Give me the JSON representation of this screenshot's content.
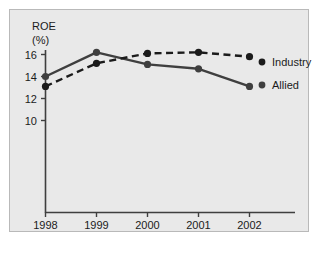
{
  "chart_data": {
    "type": "line",
    "title": "",
    "xlabel": "",
    "ylabel": "ROE (%)",
    "ylabel_lines": [
      "ROE",
      "(%)"
    ],
    "categories": [
      "1998",
      "1999",
      "2000",
      "2001",
      "2002"
    ],
    "x": [
      1998,
      1999,
      2000,
      2001,
      2002
    ],
    "series": [
      {
        "name": "Industry",
        "style": "dashed",
        "color": "#1b1b1b",
        "marker": "circle",
        "values": [
          13.1,
          15.2,
          16.1,
          16.2,
          15.8
        ]
      },
      {
        "name": "Allied",
        "style": "solid",
        "color": "#3f3f3f",
        "marker": "circle",
        "values": [
          14.0,
          16.2,
          15.1,
          14.7,
          13.1
        ]
      }
    ],
    "yticks": [
      10,
      12,
      14,
      16
    ],
    "ytick_labels": [
      "10",
      "12",
      "14",
      "16"
    ],
    "ylim": [
      3.2,
      17.2
    ],
    "xlim": [
      1997.7,
      2002.6
    ],
    "grid": false,
    "legend_position": "right",
    "legend_entries": [
      {
        "label": "Industry",
        "marker": "circle",
        "color": "#1b1b1b"
      },
      {
        "label": "Allied",
        "marker": "circle",
        "color": "#3f3f3f"
      }
    ]
  },
  "axis": {
    "y_title_line1": "ROE",
    "y_title_line2": "(%)",
    "ytick_0": "16",
    "ytick_1": "14",
    "ytick_2": "12",
    "ytick_3": "10",
    "xtick_0": "1998",
    "xtick_1": "1999",
    "xtick_2": "2000",
    "xtick_3": "2001",
    "xtick_4": "2002"
  },
  "legend": {
    "industry_label": "Industry",
    "allied_label": "Allied"
  },
  "colors": {
    "panel_background": "#e9e9e9",
    "panel_border": "#b9b9b9",
    "page_background": "#ffffff",
    "axis": "#3f3f3f",
    "industry_line": "#1b1b1b",
    "allied_line": "#3f3f3f",
    "text": "#1b1b1b"
  }
}
